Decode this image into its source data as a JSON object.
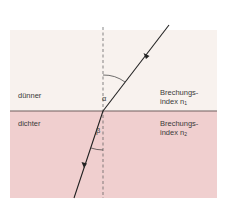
{
  "colors": {
    "thinner_medium": "#f8f2ee",
    "denser_medium": "#f0cfcf",
    "interface": "#6e5e5e",
    "ray": "#222222",
    "normal": "#555555"
  },
  "media": {
    "top": {
      "label": "dünner",
      "index_label_line1": "Brechungs-",
      "index_label_line2": "index n",
      "index_sub": "1"
    },
    "bottom": {
      "label": "dichter",
      "index_label_line1": "Brechungs-",
      "index_label_line2": "index n",
      "index_sub": "2"
    }
  },
  "angles": {
    "incidence": "α",
    "refraction": "β"
  }
}
